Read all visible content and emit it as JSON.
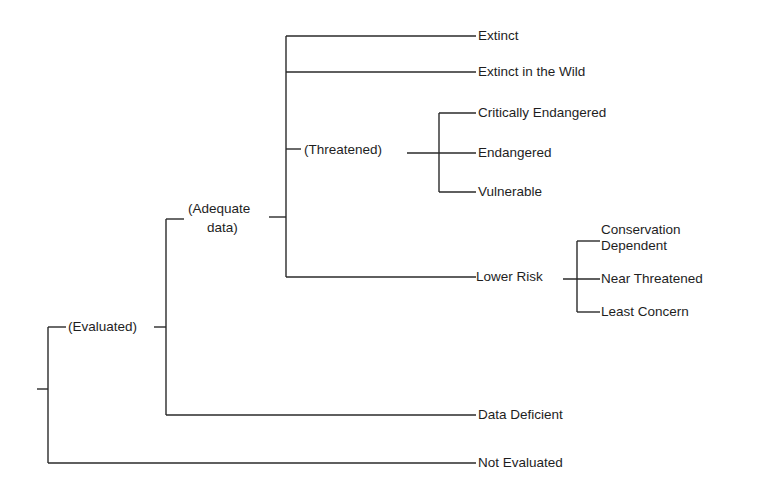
{
  "diagram": {
    "type": "tree",
    "title": "",
    "nodes": {
      "evaluated": "(Evaluated)",
      "adequate_data_line1": "(Adequate",
      "adequate_data_line2": "data)",
      "threatened": "(Threatened)",
      "extinct": "Extinct",
      "extinct_in_wild": "Extinct in the Wild",
      "critically_endangered": "Critically Endangered",
      "endangered": "Endangered",
      "vulnerable": "Vulnerable",
      "lower_risk": "Lower Risk",
      "conservation_dependent_line1": "Conservation",
      "conservation_dependent_line2": "Dependent",
      "near_threatened": "Near Threatened",
      "least_concern": "Least Concern",
      "data_deficient": "Data Deficient",
      "not_evaluated": "Not Evaluated"
    },
    "hierarchy": [
      {
        "label": "(Evaluated)",
        "children": [
          {
            "label": "(Adequate data)",
            "children": [
              {
                "label": "Extinct"
              },
              {
                "label": "Extinct in the Wild"
              },
              {
                "label": "(Threatened)",
                "children": [
                  {
                    "label": "Critically Endangered"
                  },
                  {
                    "label": "Endangered"
                  },
                  {
                    "label": "Vulnerable"
                  }
                ]
              },
              {
                "label": "Lower Risk",
                "children": [
                  {
                    "label": "Conservation Dependent"
                  },
                  {
                    "label": "Near Threatened"
                  },
                  {
                    "label": "Least Concern"
                  }
                ]
              }
            ]
          },
          {
            "label": "Data Deficient"
          }
        ]
      },
      {
        "label": "Not Evaluated"
      }
    ],
    "line_color": "#2a2a2a",
    "background": "#ffffff"
  }
}
